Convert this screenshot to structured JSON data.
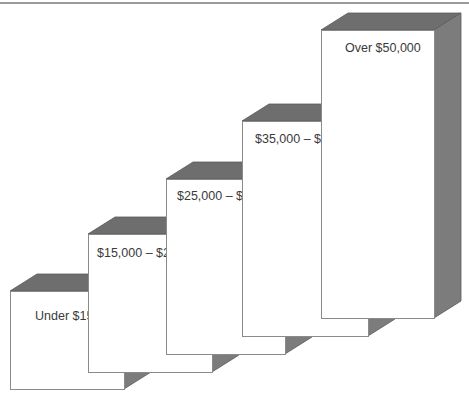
{
  "chart_data": {
    "type": "bar",
    "style": "3d-stepped-boxes",
    "title": "",
    "xlabel": "",
    "ylabel": "",
    "categories": [
      "Under $15,000",
      "$15,000 – $25,000",
      "$25,000 – $35,000",
      "$35,000 – $50,000",
      "Over $50,000"
    ],
    "values": [
      1,
      2,
      3,
      4,
      5
    ],
    "note": "Ascending staircase of boxes representing income brackets; no numeric axis shown",
    "grid": false,
    "legend": null
  },
  "colors": {
    "front": "#ffffff",
    "top": "#6e6e6e",
    "side": "#7c7c7c",
    "edge": "#8a8a8a",
    "label": "#3a3a3a",
    "rule": "#9a9a9a"
  },
  "depth": {
    "dx": 27,
    "dy": 17
  },
  "boxes": [
    {
      "label": "Under $15,000",
      "x": 10,
      "top": 291,
      "width": 114,
      "bottom": 389,
      "label_x": 35,
      "label_y": 320
    },
    {
      "label": "$15,000 – $25,000",
      "x": 88,
      "top": 234,
      "width": 124,
      "bottom": 372,
      "label_x": 97,
      "label_y": 257
    },
    {
      "label": "$25,000 – $35,000",
      "x": 166,
      "top": 179,
      "width": 119,
      "bottom": 354,
      "label_x": 177,
      "label_y": 200
    },
    {
      "label": "$35,000 – $50,000",
      "x": 242,
      "top": 121,
      "width": 126,
      "bottom": 336,
      "label_x": 255,
      "label_y": 143
    },
    {
      "label": "Over $50,000",
      "x": 321,
      "top": 30,
      "width": 113,
      "bottom": 318,
      "label_x": 345,
      "label_y": 52
    }
  ]
}
